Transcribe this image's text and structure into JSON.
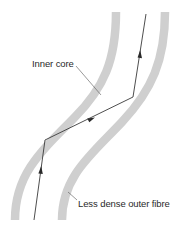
{
  "diagram": {
    "colors": {
      "cladding": "#cfcfcf",
      "ray": "#3a3a3a",
      "leader": "#555555",
      "text": "#2a2a2a",
      "background": "#ffffff"
    },
    "labels": {
      "inner_core": "Inner core",
      "outer_fibre": "Less dense outer fibre"
    },
    "ray_path": [
      {
        "x": 34,
        "y": 220
      },
      {
        "x": 45,
        "y": 140
      },
      {
        "x": 133,
        "y": 97
      },
      {
        "x": 146,
        "y": 14
      }
    ],
    "arrows": [
      {
        "segment": 1,
        "direction": "up"
      },
      {
        "segment": 2,
        "direction": "up-right"
      },
      {
        "segment": 3,
        "direction": "up"
      }
    ]
  }
}
